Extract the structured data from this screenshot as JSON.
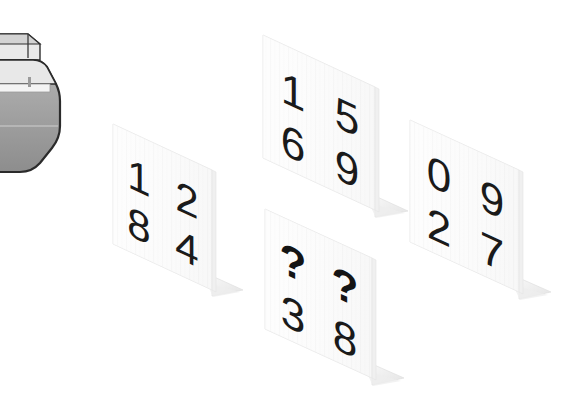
{
  "scene": {
    "title": "Isometric number cards scene",
    "background_color": "#ffffff",
    "card_face_color": "#fbfbfb",
    "card_edge_color": "#e6e6e6",
    "card_stand_color": "#f0f0f0",
    "digit_color": "#1a1a1a",
    "prop_fill_color": "#9a9a9a",
    "prop_outline_color": "#2b2b2b",
    "prop_top_color": "#cfcfcf"
  },
  "cards": [
    {
      "id": "card-left",
      "label": "card-1",
      "cells": [
        {
          "row": 0,
          "col": 0,
          "value": "1"
        },
        {
          "row": 0,
          "col": 1,
          "value": "2"
        },
        {
          "row": 1,
          "col": 0,
          "value": "8"
        },
        {
          "row": 1,
          "col": 1,
          "value": "4"
        }
      ]
    },
    {
      "id": "card-top-middle",
      "label": "card-2",
      "cells": [
        {
          "row": 0,
          "col": 0,
          "value": "1"
        },
        {
          "row": 0,
          "col": 1,
          "value": "5"
        },
        {
          "row": 1,
          "col": 0,
          "value": "6"
        },
        {
          "row": 1,
          "col": 1,
          "value": "9"
        }
      ]
    },
    {
      "id": "card-bottom-middle",
      "label": "card-3",
      "cells": [
        {
          "row": 0,
          "col": 0,
          "value": "?"
        },
        {
          "row": 0,
          "col": 1,
          "value": "?"
        },
        {
          "row": 1,
          "col": 0,
          "value": "3"
        },
        {
          "row": 1,
          "col": 1,
          "value": "8"
        }
      ]
    },
    {
      "id": "card-right",
      "label": "card-4",
      "cells": [
        {
          "row": 0,
          "col": 0,
          "value": "0"
        },
        {
          "row": 0,
          "col": 1,
          "value": "9"
        },
        {
          "row": 1,
          "col": 0,
          "value": "2"
        },
        {
          "row": 1,
          "col": 1,
          "value": "7"
        }
      ]
    }
  ],
  "prop": {
    "id": "corner-object",
    "label": "partially-visible-grey-object"
  }
}
